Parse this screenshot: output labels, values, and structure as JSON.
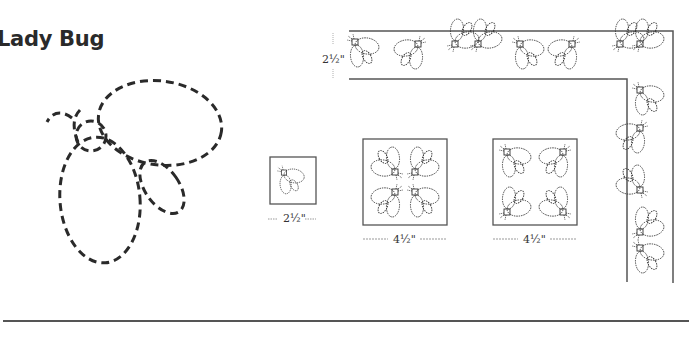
{
  "title": "Lady Bug",
  "colors": {
    "ink": "#2a2a2a",
    "line": "#555555",
    "background": "#ffffff"
  },
  "border_sample": {
    "width_label": "2½\"",
    "motif_count_horizontal": 11,
    "motif_count_vertical": 6
  },
  "blocks": [
    {
      "id": "single",
      "size_label": "2½\"",
      "motif_count": 1
    },
    {
      "id": "four-inward",
      "size_label": "4½\"",
      "motif_count": 4
    },
    {
      "id": "four-outward",
      "size_label": "4½\"",
      "motif_count": 4
    }
  ]
}
